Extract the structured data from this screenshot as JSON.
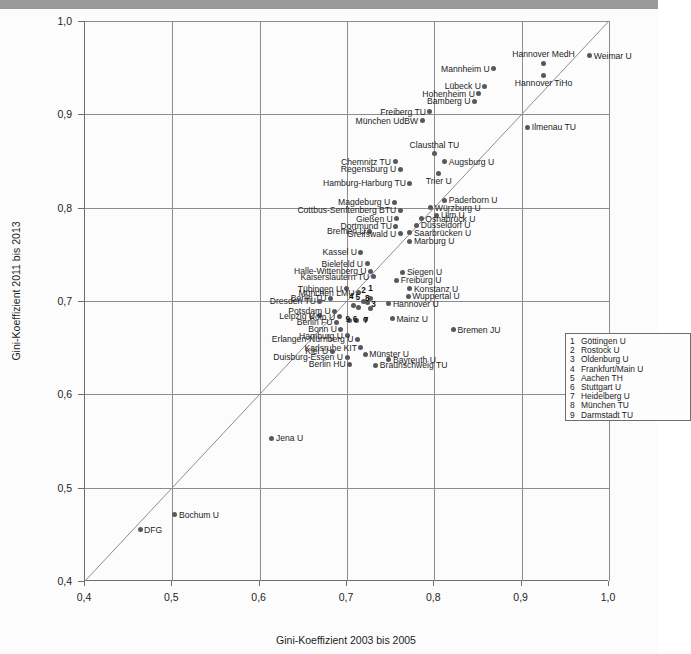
{
  "chart_data": {
    "type": "scatter",
    "title": "",
    "xlabel": "Gini-Koeffizient 2003 bis 2005",
    "ylabel": "Gini-Koeffizient 2011 bis 2013",
    "xlim": [
      0.4,
      1.0
    ],
    "ylim": [
      0.4,
      1.0
    ],
    "xticks": [
      "0,4",
      "0,5",
      "0,6",
      "0,7",
      "0,8",
      "0,9",
      "1,0"
    ],
    "yticks": [
      "0,4",
      "0,5",
      "0,6",
      "0,7",
      "0,8",
      "0,9",
      "1,0"
    ],
    "xtick_values": [
      0.4,
      0.5,
      0.6,
      0.7,
      0.8,
      0.9,
      1.0
    ],
    "ytick_values": [
      0.4,
      0.5,
      0.6,
      0.7,
      0.8,
      0.9,
      1.0
    ],
    "grid": true,
    "legend_position": "lower-right",
    "reference_line": {
      "type": "diagonal",
      "from": [
        0.4,
        0.4
      ],
      "to": [
        1.0,
        1.0
      ]
    },
    "points": [
      {
        "label": "Weimar U",
        "x": 0.978,
        "y": 0.963,
        "pos": "l"
      },
      {
        "label": "Hannover MedH",
        "x": 0.925,
        "y": 0.955,
        "pos": "t"
      },
      {
        "label": "Hannover TiHo",
        "x": 0.925,
        "y": 0.942,
        "pos": "b"
      },
      {
        "label": "Mannheim U",
        "x": 0.868,
        "y": 0.949,
        "pos": "r"
      },
      {
        "label": "Lübeck U",
        "x": 0.858,
        "y": 0.93,
        "pos": "r"
      },
      {
        "label": "Hohenheim U",
        "x": 0.851,
        "y": 0.922,
        "pos": "r"
      },
      {
        "label": "Bamberg U",
        "x": 0.846,
        "y": 0.914,
        "pos": "r"
      },
      {
        "label": "Freiberg TU",
        "x": 0.795,
        "y": 0.903,
        "pos": "r"
      },
      {
        "label": "München UdBW",
        "x": 0.786,
        "y": 0.893,
        "pos": "r"
      },
      {
        "label": "Ilmenau TU",
        "x": 0.907,
        "y": 0.886,
        "pos": "l"
      },
      {
        "label": "Clausthal TU",
        "x": 0.8,
        "y": 0.858,
        "pos": "t"
      },
      {
        "label": "Augsburg U",
        "x": 0.812,
        "y": 0.849,
        "pos": "l"
      },
      {
        "label": "Chemnitz TU",
        "x": 0.755,
        "y": 0.849,
        "pos": "r"
      },
      {
        "label": "Regensburg U",
        "x": 0.761,
        "y": 0.841,
        "pos": "r"
      },
      {
        "label": "Trier U",
        "x": 0.805,
        "y": 0.837,
        "pos": "b"
      },
      {
        "label": "Hamburg-Harburg TU",
        "x": 0.772,
        "y": 0.826,
        "pos": "r"
      },
      {
        "label": "Paderborn U",
        "x": 0.812,
        "y": 0.808,
        "pos": "l"
      },
      {
        "label": "Magdeburg U",
        "x": 0.754,
        "y": 0.806,
        "pos": "r"
      },
      {
        "label": "Würzburg U",
        "x": 0.796,
        "y": 0.8,
        "pos": "l"
      },
      {
        "label": "Cottbus-Senftenberg BTU",
        "x": 0.761,
        "y": 0.797,
        "pos": "r"
      },
      {
        "label": "Ulm U",
        "x": 0.803,
        "y": 0.792,
        "pos": "l"
      },
      {
        "label": "Gießen U",
        "x": 0.757,
        "y": 0.788,
        "pos": "r"
      },
      {
        "label": "Osnabrück U",
        "x": 0.785,
        "y": 0.788,
        "pos": "l"
      },
      {
        "label": "Düsseldorf U",
        "x": 0.78,
        "y": 0.781,
        "pos": "l"
      },
      {
        "label": "Dortmund TU",
        "x": 0.756,
        "y": 0.78,
        "pos": "r"
      },
      {
        "label": "Bremen U",
        "x": 0.726,
        "y": 0.775,
        "pos": "r"
      },
      {
        "label": "Saarbrücken U",
        "x": 0.772,
        "y": 0.773,
        "pos": "l"
      },
      {
        "label": "Greifswald U",
        "x": 0.761,
        "y": 0.772,
        "pos": "r"
      },
      {
        "label": "Marburg U",
        "x": 0.772,
        "y": 0.764,
        "pos": "l"
      },
      {
        "label": "Kassel U",
        "x": 0.716,
        "y": 0.752,
        "pos": "r"
      },
      {
        "label": "Bielefeld U",
        "x": 0.723,
        "y": 0.74,
        "pos": "r"
      },
      {
        "label": "Halle-Wittenberg U",
        "x": 0.727,
        "y": 0.732,
        "pos": "r"
      },
      {
        "label": "Siegen U",
        "x": 0.764,
        "y": 0.731,
        "pos": "l"
      },
      {
        "label": "Kaiserslautern TU",
        "x": 0.73,
        "y": 0.726,
        "pos": "r"
      },
      {
        "label": "Freiburg U",
        "x": 0.757,
        "y": 0.722,
        "pos": "l"
      },
      {
        "label": "Tübingen U",
        "x": 0.699,
        "y": 0.713,
        "pos": "r"
      },
      {
        "label": "Konstanz U",
        "x": 0.772,
        "y": 0.713,
        "pos": "l"
      },
      {
        "label": "München LMU",
        "x": 0.713,
        "y": 0.709,
        "pos": "r"
      },
      {
        "label": "Wuppertal U",
        "x": 0.77,
        "y": 0.705,
        "pos": "l"
      },
      {
        "label": "Berlin TU",
        "x": 0.681,
        "y": 0.703,
        "pos": "r"
      },
      {
        "label": "Dresden TU",
        "x": 0.669,
        "y": 0.7,
        "pos": "r"
      },
      {
        "label": "Hannover U",
        "x": 0.748,
        "y": 0.697,
        "pos": "l"
      },
      {
        "label": "Potsdam U",
        "x": 0.686,
        "y": 0.689,
        "pos": "r"
      },
      {
        "label": "Leipzig U",
        "x": 0.668,
        "y": 0.684,
        "pos": "r"
      },
      {
        "label": "Köln U",
        "x": 0.691,
        "y": 0.683,
        "pos": "r"
      },
      {
        "label": "Mainz U",
        "x": 0.752,
        "y": 0.681,
        "pos": "l"
      },
      {
        "label": "Berlin FU",
        "x": 0.688,
        "y": 0.677,
        "pos": "r"
      },
      {
        "label": "Bonn U",
        "x": 0.693,
        "y": 0.67,
        "pos": "r"
      },
      {
        "label": "Hamburg U",
        "x": 0.7,
        "y": 0.663,
        "pos": "r"
      },
      {
        "label": "Erlangen-Nürnberg U",
        "x": 0.712,
        "y": 0.659,
        "pos": "r"
      },
      {
        "label": "Bremen JU",
        "x": 0.822,
        "y": 0.669,
        "pos": "l"
      },
      {
        "label": "Karlsruhe KIT",
        "x": 0.716,
        "y": 0.65,
        "pos": "r"
      },
      {
        "label": "Münster U",
        "x": 0.721,
        "y": 0.643,
        "pos": "l"
      },
      {
        "label": "Kiel U",
        "x": 0.683,
        "y": 0.646,
        "pos": "r"
      },
      {
        "label": "Duisburg-Essen U",
        "x": 0.7,
        "y": 0.64,
        "pos": "r"
      },
      {
        "label": "Berlin HU",
        "x": 0.703,
        "y": 0.632,
        "pos": "r"
      },
      {
        "label": "Bayreuth U",
        "x": 0.748,
        "y": 0.637,
        "pos": "l"
      },
      {
        "label": "Braunschweig TU",
        "x": 0.733,
        "y": 0.631,
        "pos": "l"
      },
      {
        "label": "Jena U",
        "x": 0.614,
        "y": 0.553,
        "pos": "l"
      },
      {
        "label": "Bochum U",
        "x": 0.503,
        "y": 0.471,
        "pos": "l"
      },
      {
        "label": "DFG",
        "x": 0.463,
        "y": 0.455,
        "pos": "l"
      }
    ],
    "numbered_points": [
      {
        "num": "1",
        "name": "Göttingen U",
        "x": 0.7265,
        "y": 0.7025,
        "nx": 0.7265,
        "ny": 0.7085
      },
      {
        "num": "2",
        "name": "Rostock U",
        "x": 0.7185,
        "y": 0.6995,
        "nx": 0.7185,
        "ny": 0.706
      },
      {
        "num": "3",
        "name": "Oldenburg U",
        "x": 0.7265,
        "y": 0.6915,
        "nx": 0.73,
        "ny": 0.6915
      },
      {
        "num": "4",
        "name": "Frankfurt/Main U",
        "x": 0.7075,
        "y": 0.6955,
        "nx": 0.7045,
        "ny": 0.7
      },
      {
        "num": "5",
        "name": "Aachen TH",
        "x": 0.713,
        "y": 0.6935,
        "nx": 0.712,
        "ny": 0.6985
      },
      {
        "num": "6",
        "name": "Stuttgart U",
        "x": 0.711,
        "y": 0.679,
        "nx": 0.709,
        "ny": 0.675
      },
      {
        "num": "7",
        "name": "Heidelberg U",
        "x": 0.7215,
        "y": 0.6805,
        "nx": 0.7215,
        "ny": 0.674
      },
      {
        "num": "8",
        "name": "München TU",
        "x": 0.723,
        "y": 0.698,
        "nx": 0.723,
        "ny": 0.698
      },
      {
        "num": "9",
        "name": "Darmstadt TU",
        "x": 0.703,
        "y": 0.679,
        "nx": 0.7005,
        "ny": 0.6755
      }
    ]
  },
  "legend": {
    "items": [
      {
        "key": "1",
        "label": "Göttingen U"
      },
      {
        "key": "2",
        "label": "Rostock U"
      },
      {
        "key": "3",
        "label": "Oldenburg U"
      },
      {
        "key": "4",
        "label": "Frankfurt/Main U"
      },
      {
        "key": "5",
        "label": "Aachen TH"
      },
      {
        "key": "6",
        "label": "Stuttgart U"
      },
      {
        "key": "7",
        "label": "Heidelberg U"
      },
      {
        "key": "8",
        "label": "München TU"
      },
      {
        "key": "9",
        "label": "Darmstadt TU"
      }
    ]
  },
  "colors": {
    "point": "#58585a",
    "grid": "#8d8d8d",
    "axis": "#6d6d6d",
    "text": "#1c1c1c",
    "topband": "#9a9a9a"
  }
}
